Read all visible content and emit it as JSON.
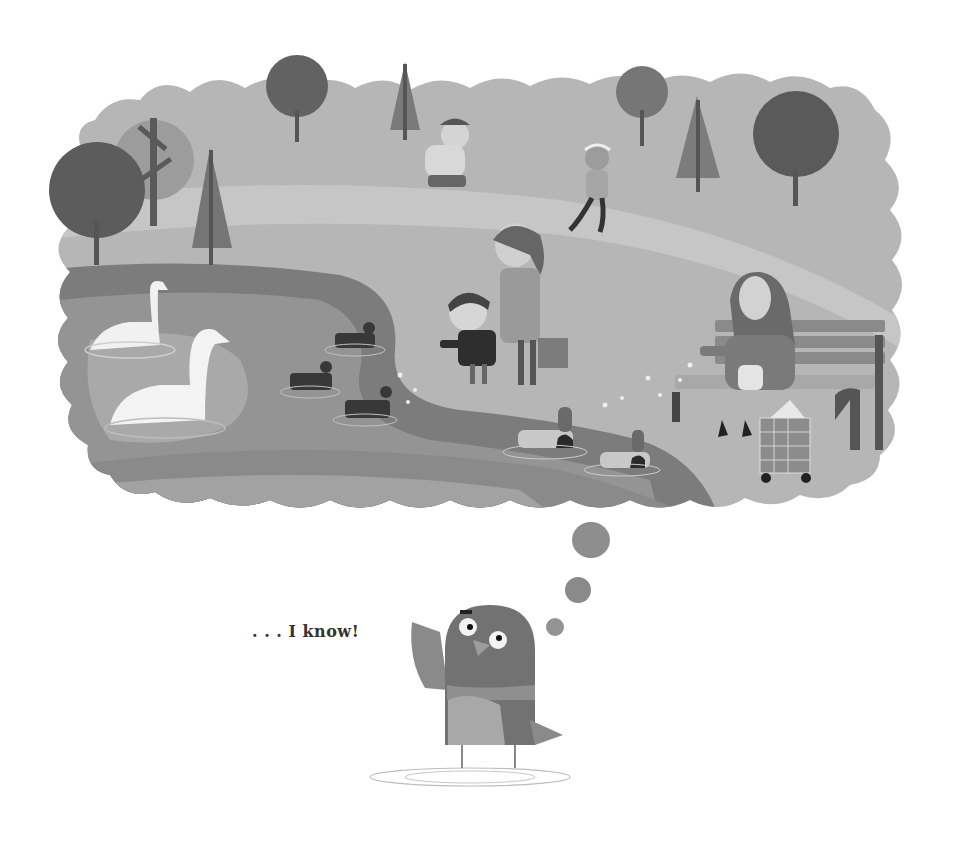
{
  "page": {
    "caption": ". . . I know!",
    "background": "#ffffff"
  },
  "illustration": {
    "description": "Thought bubble showing a park scene with a pond, swans, ducks, joggers, a mother and child, and an elderly woman on a bench feeding birds; a pigeon below thinks of it.",
    "colors": {
      "grass": "#b4b4b4",
      "path": "#c4c4c4",
      "pond_dark": "#7c7c7c",
      "pond_mid": "#939393",
      "pond_light": "#a9a9a9",
      "tree_dark": "#5e5e5e",
      "tree_mid": "#7a7a7a",
      "swan": "#f2f2f2",
      "coot": "#3a3a3a",
      "pigeon": "#727272",
      "pigeon_belly": "#a6a6a6",
      "bubble": "#8c8c8c"
    },
    "elements": {
      "trees": [
        "round-tree",
        "bare-tree",
        "pine-tree",
        "round-tree",
        "pine-tree",
        "round-tree",
        "pine-tree",
        "round-tree"
      ],
      "people": [
        "jogger-with-earmuffs",
        "jogger-girl-headband",
        "mother",
        "boy",
        "elderly-woman"
      ],
      "birds": [
        "swan",
        "swan",
        "coot",
        "coot",
        "coot",
        "mallard",
        "mallard",
        "pigeon"
      ],
      "objects": [
        "bench",
        "shopping-trolley",
        "handbag"
      ],
      "thought_bubbles": 3
    }
  }
}
